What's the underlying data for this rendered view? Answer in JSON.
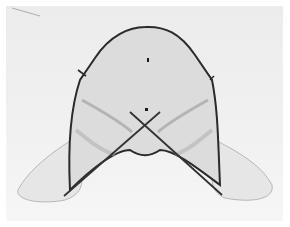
{
  "image": {
    "kind": "grayscale specimen photograph",
    "subject": "bilobed translucent anatomical structure with dark outline and two crossing rods",
    "colors": {
      "background": "#f0f0f0",
      "outline": "#2a2a2a",
      "tissue": "#bcbcbc",
      "border": "#ffffff"
    }
  }
}
